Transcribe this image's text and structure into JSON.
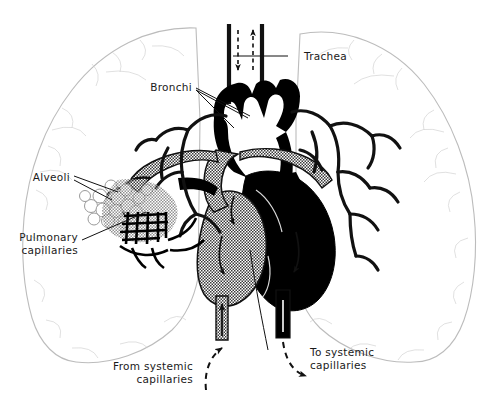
{
  "figure": {
    "background_color": "#ffffff",
    "ink_color": "#1a1a1a",
    "lung_outline_color": "#b9b9b9",
    "deoxygenated_fill": "#000000",
    "oxygenated_fill": "#9d9d9d"
  },
  "labels": {
    "trachea": "Trachea",
    "bronchi": "Bronchi",
    "alveoli": "Alveoli",
    "pulmonary_capillaries_line1": "Pulmonary",
    "pulmonary_capillaries_line2": "capillaries",
    "from_systemic_line1": "From  systemic",
    "from_systemic_line2": "capillaries",
    "to_systemic_line1": "To  systemic",
    "to_systemic_line2": "capillaries"
  },
  "flow_arrows": {
    "trachea_in": "down-arrow-inhale",
    "trachea_out": "up-arrow-exhale",
    "vena_cava_in": "up-arrow-venous-return",
    "aorta_out": "down-arrow-systemic-output"
  }
}
